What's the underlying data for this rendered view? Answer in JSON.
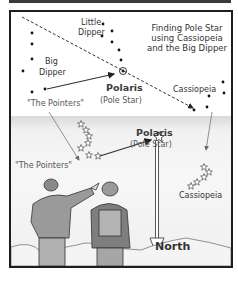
{
  "title": {
    "lines": [
      "Finding Pole Star",
      "using Cassiopeia",
      "and the Big Dipper"
    ]
  },
  "sky_chart": {
    "little_dipper": {
      "line1": "Little",
      "line2": "Dipper"
    },
    "big_dipper": {
      "line1": "Big",
      "line2": "Dipper"
    },
    "pointers": "\"The Pointers\"",
    "polaris": "Polaris",
    "polaris_sub": "(Pole Star)",
    "cassiopeia": "Cassiopeia"
  },
  "scene": {
    "pointers": "\"The Pointers\"",
    "polaris": "Polaris",
    "polaris_sub": "(Pole Star)",
    "cassiopeia": "Cassiopeia",
    "north": "North"
  },
  "colors": {
    "frame": "#1e1e1e",
    "text": "#333333",
    "sky_band": "#d9d9d9"
  }
}
